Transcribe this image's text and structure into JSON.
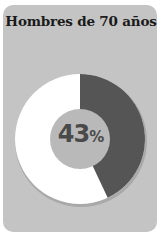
{
  "card": {
    "title": "Hombres de 70 años"
  },
  "chart_data": {
    "type": "pie",
    "title": "Hombres de 70 años",
    "style": "donut",
    "slices": [
      {
        "label": "highlighted",
        "value": 43,
        "color": "#555555"
      },
      {
        "label": "rest",
        "value": 57,
        "color": "#ffffff"
      }
    ],
    "center_label": {
      "value": "43",
      "unit": "%"
    },
    "colors": {
      "card_bg": "#c4c4c4",
      "center_bg": "#b8b8b8",
      "text": "#4a4a4a"
    }
  }
}
